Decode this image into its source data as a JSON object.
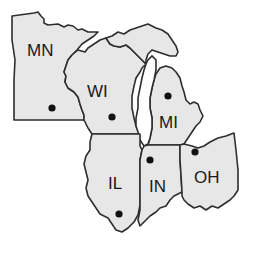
{
  "map": {
    "region": "Midwest / Great Lakes states",
    "fill_color": "#e7e7e7",
    "border_color": "#2e2e2e",
    "states": [
      {
        "abbr": "MN",
        "label_x": 27,
        "label_y": 56,
        "capital_x": 52,
        "capital_y": 108
      },
      {
        "abbr": "WI",
        "label_x": 87,
        "label_y": 97,
        "capital_x": 112,
        "capital_y": 117
      },
      {
        "abbr": "MI",
        "label_x": 159,
        "label_y": 128,
        "capital_x": 168,
        "capital_y": 96
      },
      {
        "abbr": "IL",
        "label_x": 108,
        "label_y": 189,
        "capital_x": 119,
        "capital_y": 214
      },
      {
        "abbr": "IN",
        "label_x": 149,
        "label_y": 192,
        "capital_x": 150,
        "capital_y": 160
      },
      {
        "abbr": "OH",
        "label_x": 194,
        "label_y": 183,
        "capital_x": 195,
        "capital_y": 152
      }
    ]
  }
}
